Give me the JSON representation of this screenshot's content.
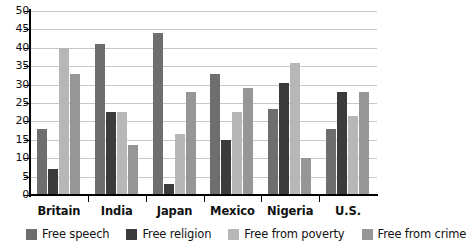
{
  "chart_data": {
    "type": "bar",
    "title": "",
    "xlabel": "",
    "ylabel": "",
    "ylim": [
      0,
      50
    ],
    "ytick_step": 5,
    "yticks": [
      50,
      45,
      40,
      35,
      30,
      25,
      20,
      15,
      10,
      5,
      0
    ],
    "grid": true,
    "legend_position": "bottom",
    "categories": [
      "Britain",
      "India",
      "Japan",
      "Mexico",
      "Nigeria",
      "U.S."
    ],
    "series": [
      {
        "name": "Free speech",
        "color": "#6e6e6e",
        "values": [
          18,
          41,
          44,
          33,
          23.5,
          18
        ]
      },
      {
        "name": "Free religion",
        "color": "#3b3b3b",
        "values": [
          7,
          22.5,
          3,
          15,
          30.5,
          28
        ]
      },
      {
        "name": "Free from poverty",
        "color": "#b7b7b7",
        "values": [
          40,
          22.5,
          16.5,
          22.5,
          36,
          21.5
        ]
      },
      {
        "name": "Free from crime",
        "color": "#969696",
        "values": [
          33,
          13.5,
          28,
          29,
          10,
          28
        ]
      }
    ]
  },
  "colors": {
    "axis": "#000000",
    "gridline": "#c8c8c8",
    "background": "#ffffff",
    "text": "#111111"
  }
}
